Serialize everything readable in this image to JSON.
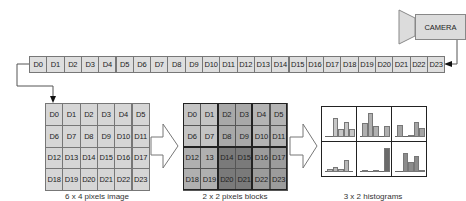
{
  "camera": {
    "label": "CAMERA"
  },
  "strip": {
    "cells": [
      "D0",
      "D1",
      "D2",
      "D3",
      "D4",
      "D5",
      "D6",
      "D7",
      "D8",
      "D9",
      "D10",
      "D11",
      "D12",
      "D13",
      "D14",
      "D15",
      "D16",
      "D17",
      "D18",
      "D19",
      "D20",
      "D21",
      "D22",
      "D23"
    ]
  },
  "image_grid": {
    "caption": "6 x 4 pixels image",
    "cols": 6,
    "rows": 4,
    "cells": [
      "D0",
      "D1",
      "D2",
      "D3",
      "D4",
      "D5",
      "D6",
      "D7",
      "D8",
      "D9",
      "D10",
      "D11",
      "D12",
      "D13",
      "D14",
      "D15",
      "D16",
      "D17",
      "D18",
      "D19",
      "D20",
      "D21",
      "D22",
      "D23"
    ]
  },
  "block_grid": {
    "caption": "2 x 2  pixels blocks",
    "cols": 6,
    "rows": 4,
    "cells": [
      "D0",
      "D1",
      "D2",
      "D3",
      "D4",
      "D5",
      "D6",
      "D7",
      "D8",
      "D9",
      "D10",
      "D11",
      "D12",
      "13",
      "D14",
      "D15",
      "D16",
      "D17",
      "D18",
      "D19",
      "D20",
      "D21",
      "D22",
      "D23"
    ],
    "block_colors": [
      "#c4c4c4",
      "#a8a8a8",
      "#b4b4b4",
      "#b0b0b0",
      "#7a7a7a",
      "#9c9c9c"
    ]
  },
  "histograms": {
    "caption": "3 x 2  histograms",
    "cols": 3,
    "rows": 2,
    "items": [
      {
        "color": "#c6c6c6",
        "bars": [
          0,
          0.75,
          0.33,
          0.6,
          0.33
        ]
      },
      {
        "color": "#b0b0b0",
        "bars": [
          0.55,
          0.95,
          0.45,
          0,
          0.45
        ]
      },
      {
        "color": "#a4a4a4",
        "bars": [
          0.5,
          0,
          0.1,
          0.6,
          0.35
        ]
      },
      {
        "color": "#b8b8b8",
        "bars": [
          0.12,
          0.22,
          0.12,
          0.5,
          0
        ]
      },
      {
        "color": "#6a6a6a",
        "bars": [
          0.1,
          0,
          0.1,
          0,
          0.95
        ]
      },
      {
        "color": "#8c8c8c",
        "bars": [
          0,
          0.75,
          0.4,
          0.65,
          0.1
        ]
      }
    ]
  }
}
